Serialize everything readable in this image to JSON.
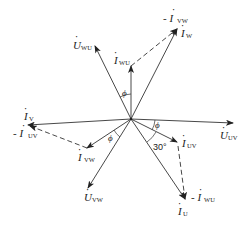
{
  "diagram": {
    "type": "phasor-diagram",
    "origin": [
      131,
      119
    ],
    "vectors": [
      {
        "id": "U_UV",
        "kind": "voltage",
        "style": "solid",
        "from": [
          131,
          119
        ],
        "to": [
          233,
          123
        ],
        "label": "U",
        "subscript": "UV",
        "dot": true
      },
      {
        "id": "U_WU",
        "kind": "voltage",
        "style": "solid",
        "from": [
          131,
          119
        ],
        "to": [
          95,
          46
        ],
        "label": "U",
        "subscript": "WU",
        "dot": true
      },
      {
        "id": "U_VW",
        "kind": "voltage",
        "style": "solid",
        "from": [
          131,
          119
        ],
        "to": [
          88,
          188
        ],
        "label": "U",
        "subscript": "VW",
        "dot": true
      },
      {
        "id": "I_UV",
        "kind": "current",
        "style": "solid",
        "from": [
          131,
          119
        ],
        "to": [
          177,
          142
        ],
        "label": "I",
        "subscript": "UV",
        "dot": true
      },
      {
        "id": "I_WU",
        "kind": "current",
        "style": "solid",
        "from": [
          131,
          119
        ],
        "to": [
          131,
          66
        ],
        "label": "I",
        "subscript": "WU",
        "dot": true
      },
      {
        "id": "I_VW",
        "kind": "current",
        "style": "solid",
        "from": [
          131,
          119
        ],
        "to": [
          87,
          148
        ],
        "label": "I",
        "subscript": "VW",
        "dot": true
      },
      {
        "id": "I_U",
        "kind": "current",
        "style": "solid",
        "from": [
          131,
          119
        ],
        "to": [
          185,
          199
        ],
        "label": "I",
        "subscript": "U",
        "dot": true
      },
      {
        "id": "I_V",
        "kind": "current",
        "style": "solid",
        "from": [
          131,
          119
        ],
        "to": [
          28,
          125
        ],
        "label": "I",
        "subscript": "V",
        "dot": true
      },
      {
        "id": "I_W",
        "kind": "current",
        "style": "solid",
        "from": [
          131,
          119
        ],
        "to": [
          177,
          29
        ],
        "label": "I",
        "subscript": "W",
        "dot": true
      },
      {
        "id": "neg_I_WU",
        "kind": "current",
        "style": "dashed",
        "from": [
          177,
          144
        ],
        "to": [
          185,
          199
        ],
        "label": "- I",
        "subscript": "WU",
        "dot": true
      },
      {
        "id": "neg_I_UV",
        "kind": "current",
        "style": "dashed",
        "from": [
          87,
          148
        ],
        "to": [
          30,
          126
        ],
        "label": "- I",
        "subscript": "UV",
        "dot": true
      },
      {
        "id": "neg_I_VW",
        "kind": "current",
        "style": "dashed",
        "from": [
          131,
          66
        ],
        "to": [
          177,
          29
        ],
        "label": "- I",
        "subscript": "VW",
        "dot": true
      }
    ],
    "angles": [
      {
        "label": "ϕ",
        "between": [
          "I_WU",
          "U_WU"
        ]
      },
      {
        "label": "ϕ",
        "between": [
          "U_UV",
          "I_UV"
        ]
      },
      {
        "label": "ϕ",
        "between": [
          "I_VW",
          "U_VW"
        ]
      },
      {
        "label": "30°",
        "between": [
          "I_UV",
          "I_U"
        ]
      }
    ],
    "labels": {
      "U_UV": {
        "main": "U",
        "sub": "UV"
      },
      "U_WU": {
        "main": "U",
        "sub": "WU"
      },
      "U_VW": {
        "main": "U",
        "sub": "VW"
      },
      "I_UV": {
        "main": "I",
        "sub": "UV"
      },
      "I_WU": {
        "main": "I",
        "sub": "WU"
      },
      "I_VW": {
        "main": "I",
        "sub": "VW"
      },
      "I_U": {
        "main": "I",
        "sub": "U"
      },
      "I_V": {
        "main": "I",
        "sub": "V"
      },
      "I_W": {
        "main": "I",
        "sub": "W"
      },
      "neg_I_WU": {
        "main": "- I",
        "sub": "WU"
      },
      "neg_I_UV": {
        "main": "- I",
        "sub": "UV"
      },
      "neg_I_VW": {
        "main": "- I",
        "sub": "VW"
      },
      "phi": "ϕ",
      "thirty": "30°",
      "dot": "·"
    }
  }
}
